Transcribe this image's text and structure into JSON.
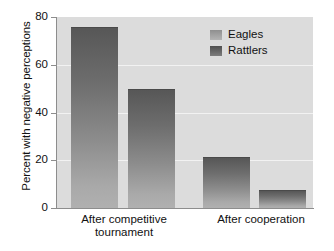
{
  "chart_data": {
    "type": "bar",
    "title": "",
    "xlabel": "",
    "ylabel": "Percent with negative perceptions",
    "ylim": [
      0,
      80
    ],
    "yticks": [
      0,
      20,
      40,
      60,
      80
    ],
    "grid": "horizontal-white",
    "legend_position": "top-right",
    "categories": [
      "After competitive tournament",
      "After cooperation"
    ],
    "category_lines": [
      [
        "After competitive",
        "tournament"
      ],
      [
        "After cooperation",
        ""
      ]
    ],
    "series": [
      {
        "name": "Eagles",
        "values": [
          76,
          21.5
        ]
      },
      {
        "name": "Rattlers",
        "values": [
          50,
          7.5
        ]
      }
    ],
    "colors": {
      "plot_background": "#dcdcdc",
      "bar_top": "#575757",
      "bar_bottom": "#b0b0b0",
      "gridline": "#f2f2f2",
      "axis": "#8d8d8d",
      "text": "#111111"
    }
  },
  "axis": {
    "y_title": "Percent with negative perceptions",
    "tick_0": "0",
    "tick_20": "20",
    "tick_40": "40",
    "tick_60": "60",
    "tick_80": "80"
  },
  "legend": {
    "eagles": "Eagles",
    "rattlers": "Rattlers"
  },
  "xaxis": {
    "group1_line1": "After competitive",
    "group1_line2": "tournament",
    "group2_line1": "After cooperation"
  }
}
